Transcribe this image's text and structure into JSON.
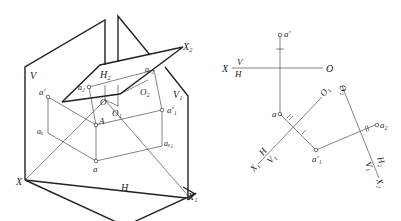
{
  "figure": {
    "left_diagram": {
      "title": "Pictorial view of two successive auxiliary projection planes",
      "labels": {
        "V": "V",
        "H": "H",
        "H2": "H₂",
        "V1": "V₁",
        "X": "X",
        "X1": "X₁",
        "X2": "X₂",
        "a_prime": "a′",
        "a": "a",
        "a1_prime": "a′₁",
        "a2": "a₂",
        "ax": "aₓ",
        "ax1": "aₓ₁",
        "ax2": "aₓ₂",
        "A": "A",
        "O": "O",
        "O1": "O₁",
        "O2": "O₂"
      }
    },
    "right_diagram": {
      "title": "Orthographic projection with two replacement planes",
      "labels": {
        "X": "X",
        "V_over_H_top": "V",
        "V_over_H_bottom": "H",
        "O": "O",
        "a_prime": "a′",
        "a": "a",
        "O1": "O₁",
        "O2": "O₂",
        "a1_prime": "a′₁",
        "a2": "a₂",
        "X1": "X₁",
        "H_over_V1_top": "H",
        "H_over_V1_bottom": "V₁",
        "H2_over_V1_top": "H₂",
        "H2_over_V1_bottom": "V₁",
        "X2": "X₂"
      }
    }
  }
}
